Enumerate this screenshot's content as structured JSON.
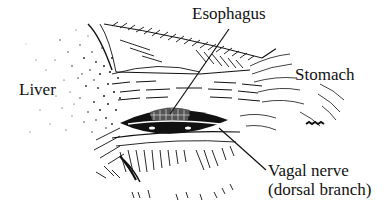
{
  "figure": {
    "type": "anatomical line illustration",
    "ink_color": "#111111",
    "background_color": "#ffffff"
  },
  "labels": {
    "esophagus": "Esophagus",
    "liver": "Liver",
    "stomach": "Stomach",
    "vagal_nerve_line1": "Vagal nerve",
    "vagal_nerve_line2": "(dorsal branch)"
  },
  "leader_lines": [
    {
      "label": "esophagus",
      "from": [
        229,
        29
      ],
      "to": [
        170,
        114
      ]
    },
    {
      "label": "vagal_nerve",
      "from": [
        266,
        170
      ],
      "to": [
        219,
        128
      ]
    }
  ]
}
